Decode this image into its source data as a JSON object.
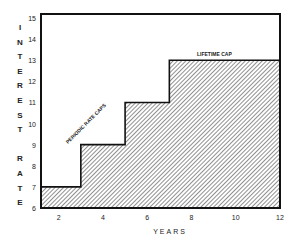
{
  "chart_data": {
    "type": "area",
    "title": "",
    "xlabel": "YEARS",
    "ylabel": "INTEREST RATE",
    "xlim": [
      1.2,
      12
    ],
    "ylim": [
      6,
      15
    ],
    "x_ticks": [
      2,
      4,
      6,
      8,
      10,
      12
    ],
    "y_ticks": [
      6,
      7,
      8,
      9,
      10,
      11,
      12,
      13,
      14,
      15
    ],
    "grid": false,
    "legend": null,
    "series": [
      {
        "name": "Interest rate with periodic caps",
        "step": true,
        "fill": "diagonal-hatch",
        "points": [
          {
            "x": 1.2,
            "y": 7
          },
          {
            "x": 3,
            "y": 7
          },
          {
            "x": 3,
            "y": 9
          },
          {
            "x": 5,
            "y": 9
          },
          {
            "x": 5,
            "y": 11
          },
          {
            "x": 7,
            "y": 11
          },
          {
            "x": 7,
            "y": 13
          },
          {
            "x": 12,
            "y": 13
          }
        ]
      }
    ],
    "annotations": [
      {
        "text": "PERIODIC RATE CAPS",
        "x": 3.8,
        "y": 10.2,
        "rotation": -45
      },
      {
        "text": "LIFETIME CAP",
        "x": 9.5,
        "y": 13.2
      }
    ]
  },
  "labels": {
    "y_axis_letters": [
      "I",
      "N",
      "T",
      "E",
      "R",
      "E",
      "S",
      "T",
      "",
      "R",
      "A",
      "T",
      "E"
    ],
    "x_axis": "YEARS",
    "periodic": "PERIODIC RATE CAPS",
    "lifetime": "LIFETIME CAP"
  },
  "colors": {
    "line": "#111111",
    "hatch": "#555555",
    "background": "#ffffff"
  }
}
